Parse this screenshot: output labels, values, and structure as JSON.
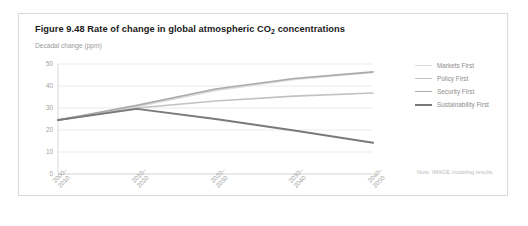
{
  "figure": {
    "title_prefix": "Figure 9.48 Rate of change in global atmospheric CO",
    "title_subscript": "2",
    "title_suffix": " concentrations",
    "title_full": "Figure 9.48 Rate of change in global atmospheric CO2 concentrations",
    "note": "Note: IMAGE modeling results."
  },
  "chart_data": {
    "type": "line",
    "title": "Figure 9.48 Rate of change in global atmospheric CO2 concentrations",
    "subtitle": "Decadal change (ppm)",
    "xlabel": "",
    "ylabel": "Decadal change (ppm)",
    "categories": [
      "2000–\n2010",
      "2010–\n2020",
      "2020–\n2030",
      "2030–\n2040",
      "2040–\n2050"
    ],
    "categories_flat": [
      "2000-2010",
      "2010-2020",
      "2020-2030",
      "2030-2040",
      "2040-2050"
    ],
    "ylim": [
      0,
      50
    ],
    "yticks": [
      0,
      10,
      20,
      30,
      40,
      50
    ],
    "grid": "horizontal",
    "legend_position": "right",
    "series": [
      {
        "name": "Markets First",
        "color": "#dcdcdc",
        "width": 1.6,
        "values": [
          24.5,
          30.6,
          38.0,
          43.0,
          46.2
        ]
      },
      {
        "name": "Policy First",
        "color": "#c2c2c2",
        "width": 1.6,
        "values": [
          24.5,
          30.0,
          33.2,
          35.4,
          36.8
        ]
      },
      {
        "name": "Security First",
        "color": "#ababab",
        "width": 1.6,
        "values": [
          24.5,
          31.2,
          38.6,
          43.4,
          46.4
        ]
      },
      {
        "name": "Sustainability First",
        "color": "#7a7a7a",
        "width": 2.0,
        "values": [
          24.5,
          29.6,
          25.0,
          19.8,
          14.2
        ]
      }
    ]
  }
}
